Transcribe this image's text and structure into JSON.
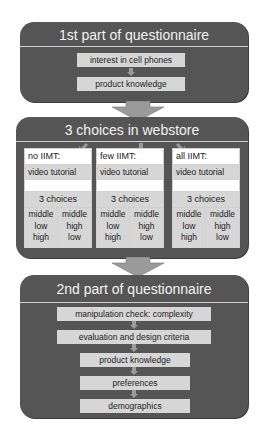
{
  "part1": {
    "title": "1st part of questionnaire",
    "steps": [
      "interest in cell phones",
      "product knowledge"
    ]
  },
  "webstore": {
    "title": "3 choices in webstore",
    "conditions": [
      {
        "label": "no IIMT:",
        "tutorial": "video tutorial",
        "choices_label": "3 choices",
        "orders": [
          [
            "middle",
            "low",
            "high"
          ],
          [
            "middle",
            "high",
            "low"
          ]
        ]
      },
      {
        "label": "few IIMT:",
        "tutorial": "video tutorial",
        "choices_label": "3 choices",
        "orders": [
          [
            "middle",
            "low",
            "high"
          ],
          [
            "middle",
            "high",
            "low"
          ]
        ]
      },
      {
        "label": "all IIMT:",
        "tutorial": "video tutorial",
        "choices_label": "3 choices",
        "orders": [
          [
            "middle",
            "low",
            "high"
          ],
          [
            "middle",
            "high",
            "low"
          ]
        ]
      }
    ]
  },
  "part2": {
    "title": "2nd part of questionnaire",
    "steps": [
      "manipulation check: complexity",
      "evaluation and design criteria",
      "product knowledge",
      "preferences",
      "demographics"
    ]
  },
  "colors": {
    "panel": "#555555",
    "step_fill": "#d6d6d6",
    "arrow": "#9a9a9a",
    "title_text": "#f2f2f2"
  }
}
